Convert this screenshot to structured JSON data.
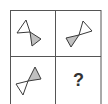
{
  "puzzle": {
    "type": "2x2 figure sequence puzzle",
    "colors": {
      "outline": "#3a3a3a",
      "shaded_fill": "#c0c0c0",
      "blank_fill": "#ffffff",
      "grid_line": "#555555"
    },
    "cells": [
      {
        "position": "top-left",
        "figure": "bowtie",
        "white_triangle": "upper-left",
        "gray_triangle": "lower-right"
      },
      {
        "position": "top-right",
        "figure": "bowtie",
        "white_triangle": "upper-right",
        "gray_triangle": "lower-left"
      },
      {
        "position": "bottom-left",
        "figure": "bowtie",
        "white_triangle": "lower-left",
        "gray_triangle": "upper-right"
      },
      {
        "position": "bottom-right",
        "figure": "unknown",
        "label": "?"
      }
    ]
  }
}
